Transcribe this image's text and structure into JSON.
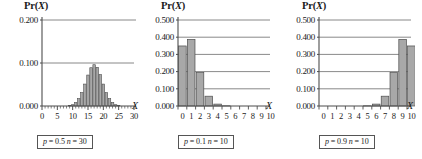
{
  "figure": {
    "background_color": "#ffffff",
    "bar_fill": "#a8a8a8",
    "bar_stroke": "#4d4d4d",
    "axis_color": "#4d4d4d",
    "grid_color": "#6b6b6b"
  },
  "panels": [
    {
      "title_pr": "Pr(",
      "title_var": "X",
      "title_close": ")",
      "axis_x_name": "X",
      "caption": {
        "p_symbol": "p",
        "p_text": " = 0.5 ",
        "n_symbol": "n",
        "n_text": " = 30",
        "full": "p = 0.5  n = 30"
      },
      "chart_data": {
        "type": "bar",
        "title": "Pr(X)",
        "xlabel": "X",
        "ylabel": "Pr(X)",
        "distribution": "binomial",
        "p": 0.5,
        "n": 30,
        "xlim": [
          0,
          30
        ],
        "ylim": [
          0.0,
          0.2
        ],
        "grid": true,
        "legend": "none",
        "ytick_labels": [
          "0.000",
          "0.100",
          "0.200"
        ],
        "ytick_values": [
          0.0,
          0.1,
          0.2
        ],
        "xtick_labels": [
          "0",
          "5",
          "10",
          "15",
          "20",
          "25",
          "30"
        ],
        "xtick_values": [
          0,
          5,
          10,
          15,
          20,
          25,
          30
        ],
        "minor_xtick_step": 1,
        "categories": [
          0,
          1,
          2,
          3,
          4,
          5,
          6,
          7,
          8,
          9,
          10,
          11,
          12,
          13,
          14,
          15,
          16,
          17,
          18,
          19,
          20,
          21,
          22,
          23,
          24,
          25,
          26,
          27,
          28,
          29,
          30
        ],
        "values": [
          0.0,
          0.0,
          0.0,
          0.0,
          0.0,
          0.0,
          0.0,
          0.0,
          0.0,
          0.001,
          0.003,
          0.008,
          0.017,
          0.031,
          0.051,
          0.072,
          0.089,
          0.096,
          0.09,
          0.073,
          0.051,
          0.031,
          0.017,
          0.008,
          0.003,
          0.001,
          0.0,
          0.0,
          0.0,
          0.0,
          0.0
        ]
      }
    },
    {
      "title_pr": "Pr(",
      "title_var": "X",
      "title_close": ")",
      "axis_x_name": "X",
      "caption": {
        "p_symbol": "p",
        "p_text": " = 0.1 ",
        "n_symbol": "n",
        "n_text": " = 10",
        "full": "p = 0.1  n = 10"
      },
      "chart_data": {
        "type": "bar",
        "title": "Pr(X)",
        "xlabel": "X",
        "ylabel": "Pr(X)",
        "distribution": "binomial",
        "p": 0.1,
        "n": 10,
        "xlim": [
          0,
          10
        ],
        "ylim": [
          0.0,
          0.5
        ],
        "grid": true,
        "legend": "none",
        "ytick_labels": [
          "0.000",
          "0.100",
          "0.200",
          "0.300",
          "0.400",
          "0.500"
        ],
        "ytick_values": [
          0.0,
          0.1,
          0.2,
          0.3,
          0.4,
          0.5
        ],
        "xtick_labels": [
          "0",
          "1",
          "2",
          "3",
          "4",
          "5",
          "6",
          "7",
          "8",
          "9",
          "10"
        ],
        "xtick_values": [
          0,
          1,
          2,
          3,
          4,
          5,
          6,
          7,
          8,
          9,
          10
        ],
        "minor_xtick_step": 1,
        "categories": [
          0,
          1,
          2,
          3,
          4,
          5,
          6,
          7,
          8,
          9,
          10
        ],
        "values": [
          0.349,
          0.387,
          0.194,
          0.057,
          0.011,
          0.001,
          0.0,
          0.0,
          0.0,
          0.0,
          0.0
        ]
      }
    },
    {
      "title_pr": "Pr(",
      "title_var": "X",
      "title_close": ")",
      "axis_x_name": "X",
      "caption": {
        "p_symbol": "p",
        "p_text": " = 0.9 ",
        "n_symbol": "n",
        "n_text": " = 10",
        "full": "p = 0.9  n = 10"
      },
      "chart_data": {
        "type": "bar",
        "title": "Pr(X)",
        "xlabel": "X",
        "ylabel": "Pr(X)",
        "distribution": "binomial",
        "p": 0.9,
        "n": 10,
        "xlim": [
          0,
          10
        ],
        "ylim": [
          0.0,
          0.5
        ],
        "grid": true,
        "legend": "none",
        "ytick_labels": [
          "0.000",
          "0.100",
          "0.200",
          "0.300",
          "0.400",
          "0.500"
        ],
        "ytick_values": [
          0.0,
          0.1,
          0.2,
          0.3,
          0.4,
          0.5
        ],
        "xtick_labels": [
          "0",
          "1",
          "2",
          "3",
          "4",
          "5",
          "6",
          "7",
          "8",
          "9",
          "10"
        ],
        "xtick_values": [
          0,
          1,
          2,
          3,
          4,
          5,
          6,
          7,
          8,
          9,
          10
        ],
        "minor_xtick_step": 1,
        "categories": [
          0,
          1,
          2,
          3,
          4,
          5,
          6,
          7,
          8,
          9,
          10
        ],
        "values": [
          0.0,
          0.0,
          0.0,
          0.0,
          0.0,
          0.001,
          0.011,
          0.057,
          0.194,
          0.387,
          0.349
        ]
      }
    }
  ]
}
